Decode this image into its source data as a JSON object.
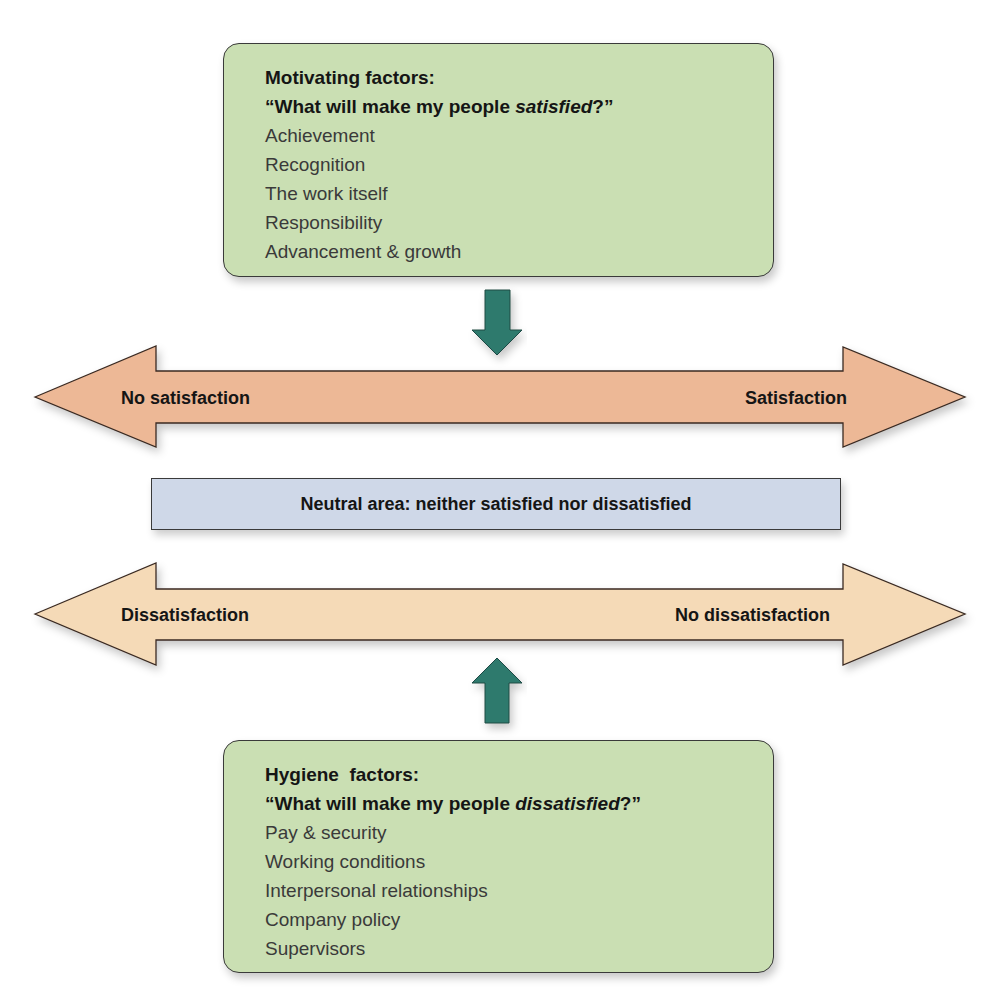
{
  "motivating": {
    "title": "Motivating factors:",
    "question_prefix": "“What will make my people ",
    "question_emphasis": "satisfied",
    "question_suffix": "?”",
    "items": [
      "Achievement",
      "Recognition",
      "The work itself",
      "Responsibility",
      "Advancement & growth"
    ]
  },
  "satisfaction_axis": {
    "left_label": "No satisfaction",
    "right_label": "Satisfaction",
    "color": "#edb896"
  },
  "neutral": {
    "label": "Neutral area: neither satisfied nor dissatisfied",
    "color": "#cfd8e8"
  },
  "dissatisfaction_axis": {
    "left_label": "Dissatisfaction",
    "right_label": "No dissatisfaction",
    "color": "#f5dab7"
  },
  "hygiene": {
    "title": "Hygiene  factors:",
    "question_prefix": "“What will make my people ",
    "question_emphasis": "dissatisfied",
    "question_suffix": "?”",
    "items": [
      "Pay & security",
      "Working conditions",
      "Interpersonal relationships",
      "Company policy",
      "Supervisors"
    ]
  },
  "colors": {
    "factor_box": "#cadfb3",
    "connector_arrow": "#2f7a6d"
  }
}
